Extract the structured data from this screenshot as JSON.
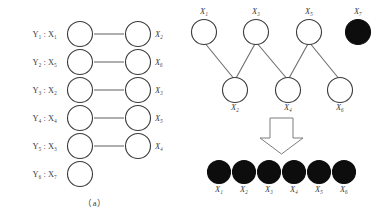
{
  "figure": {
    "panel_a": {
      "caption": "（a）",
      "rows": [
        {
          "row_label": "Y₁ : X₁",
          "left_var": "X₁",
          "right_var": "X₂",
          "has_edge": true
        },
        {
          "row_label": "Y₂ : X₅",
          "left_var": "X₅",
          "right_var": "X₆",
          "has_edge": true
        },
        {
          "row_label": "Y₃ : X₂",
          "left_var": "X₂",
          "right_var": "X₃",
          "has_edge": true
        },
        {
          "row_label": "Y₄ : X₄",
          "left_var": "X₄",
          "right_var": "X₅",
          "has_edge": true
        },
        {
          "row_label": "Y₅ : X₃",
          "left_var": "X₃",
          "right_var": "X₄",
          "has_edge": true
        },
        {
          "row_label": "Y₆ : X₇",
          "left_var": "X₇",
          "right_var": "",
          "has_edge": false
        }
      ],
      "right_labels": [
        "X₂",
        "X₆",
        "X₃",
        "X₅",
        "X₄",
        ""
      ]
    },
    "panel_b": {
      "caption": "（b）",
      "top_nodes": [
        {
          "label": "X₁",
          "filled": false
        },
        {
          "label": "X₃",
          "filled": false
        },
        {
          "label": "X₅",
          "filled": false
        },
        {
          "label": "X₇",
          "filled": true
        }
      ],
      "bottom_nodes": [
        {
          "label": "X₂",
          "filled": false
        },
        {
          "label": "X₄",
          "filled": false
        },
        {
          "label": "X₆",
          "filled": false
        }
      ],
      "edges": [
        {
          "from": "X₁",
          "to": "X₂"
        },
        {
          "from": "X₃",
          "to": "X₂"
        },
        {
          "from": "X₃",
          "to": "X₄"
        },
        {
          "from": "X₅",
          "to": "X₄"
        },
        {
          "from": "X₅",
          "to": "X₆"
        }
      ],
      "arrow": "down-arrow",
      "result_nodes": [
        {
          "label": "X₁",
          "filled": true
        },
        {
          "label": "X₂",
          "filled": true
        },
        {
          "label": "X₃",
          "filled": true
        },
        {
          "label": "X₄",
          "filled": true
        },
        {
          "label": "X₅",
          "filled": true
        },
        {
          "label": "X₆",
          "filled": true
        }
      ]
    },
    "colors": {
      "node_stroke": "#3a3a3a",
      "node_fill_open": "#ffffff",
      "node_fill_solid": "#0d0d0d",
      "edge": "#6d6d6d",
      "text": "#3c3c3c",
      "background": "#ffffff"
    }
  }
}
